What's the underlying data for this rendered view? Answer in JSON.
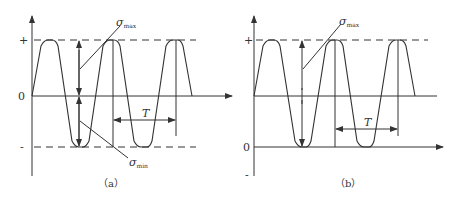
{
  "panels": [
    {
      "id": "a",
      "caption": "（a）",
      "y_ticks": {
        "plus": "+",
        "zero": "0",
        "minus": "-"
      },
      "labels": {
        "sigma_max": "σ",
        "sigma_max_sub": "max",
        "sigma_min": "σ",
        "sigma_min_sub": "min",
        "period": "T"
      },
      "description": "Symmetric alternating stress cycle between +σmax and -σmin about zero"
    },
    {
      "id": "b",
      "caption": "（b）",
      "y_ticks": {
        "plus": "+",
        "zero": "0",
        "minus": "-"
      },
      "labels": {
        "sigma_max": "σ",
        "sigma_max_sub": "max",
        "period": "T"
      },
      "description": "Pulsating (repeated) stress cycle between 0 and +σmax"
    }
  ],
  "colors": {
    "line": "#333333",
    "background": "#ffffff"
  }
}
